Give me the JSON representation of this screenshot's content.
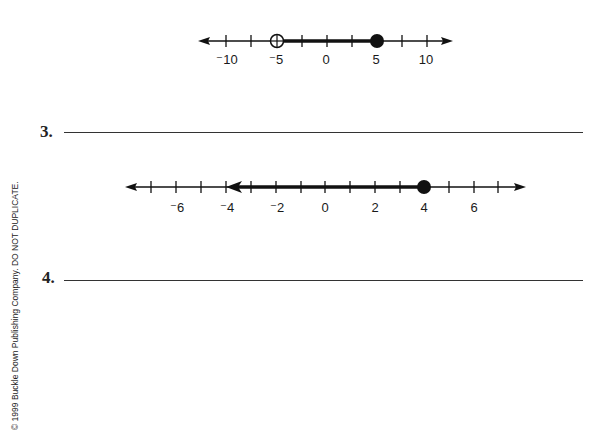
{
  "number_line_1": {
    "tick_labels": [
      "⁻10",
      "⁻5",
      "0",
      "5",
      "10"
    ],
    "tick_values": [
      -10,
      -5,
      0,
      5,
      10
    ],
    "open_point": -5,
    "closed_point": 5,
    "shaded_segment": [
      -5,
      5
    ],
    "scale_per_tick": 2.5
  },
  "problem_3": {
    "number": "3."
  },
  "number_line_2": {
    "tick_labels": [
      "⁻6",
      "⁻4",
      "⁻2",
      "0",
      "2",
      "4",
      "6"
    ],
    "tick_values": [
      -6,
      -4,
      -2,
      0,
      2,
      4,
      6
    ],
    "closed_point": 4,
    "ray_direction": "left",
    "ray_arrow_at": -4,
    "scale_per_tick": 1
  },
  "problem_4": {
    "number": "4."
  },
  "footer": {
    "copyright": "© 1999 Buckle Down Publishing Company. DO NOT DUPLICATE."
  },
  "colors": {
    "ink": "#111111",
    "paper": "#ffffff"
  }
}
